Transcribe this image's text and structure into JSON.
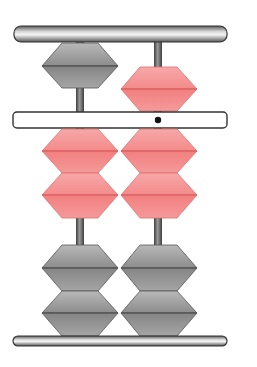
{
  "diagram": {
    "type": "abacus",
    "style": "soroban",
    "columns": 2,
    "unit_dot_column": 2,
    "represented_value": 27,
    "colors": {
      "active_bead": "#f58a8a",
      "active_bead_light": "#f9b0b0",
      "active_bead_line": "#d85a5a",
      "inactive_bead": "#8a8a8a",
      "inactive_bead_light": "#b5b5b5",
      "inactive_bead_line": "#4f4f4f",
      "rod": "#6e6e6e",
      "frame_bar": "#9a9a9a",
      "beam_fill": "#ffffff",
      "beam_border": "#333333",
      "unit_dot": "#111111"
    },
    "column_states": [
      {
        "column": 1,
        "heaven_bead": "up",
        "heaven_active": false,
        "earth_beads_active": 2,
        "earth_beads_total": 4,
        "digit": 2
      },
      {
        "column": 2,
        "heaven_bead": "down",
        "heaven_active": true,
        "earth_beads_active": 2,
        "earth_beads_total": 4,
        "digit": 7
      }
    ]
  }
}
